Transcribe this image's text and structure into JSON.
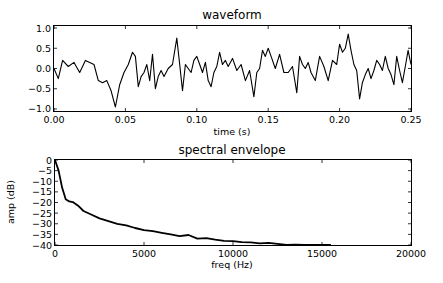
{
  "chart_data": [
    {
      "type": "line",
      "title": "waveform",
      "xlabel": "time (s)",
      "ylabel": "",
      "xlim": [
        0.0,
        0.25
      ],
      "ylim": [
        -1.05,
        1.05
      ],
      "xticks": [
        "0.00",
        "0.05",
        "0.10",
        "0.15",
        "0.20",
        "0.25"
      ],
      "yticks": [
        "1.0",
        "0.5",
        "0.0",
        "−0.5",
        "−1.0"
      ],
      "grid": false,
      "legend": null,
      "series": [
        {
          "name": "waveform",
          "color": "#000000",
          "x": [
            0.0,
            0.003,
            0.006,
            0.01,
            0.014,
            0.018,
            0.022,
            0.025,
            0.028,
            0.031,
            0.034,
            0.037,
            0.04,
            0.043,
            0.046,
            0.049,
            0.052,
            0.055,
            0.057,
            0.059,
            0.061,
            0.063,
            0.065,
            0.067,
            0.069,
            0.071,
            0.073,
            0.075,
            0.077,
            0.08,
            0.083,
            0.086,
            0.088,
            0.09,
            0.092,
            0.094,
            0.096,
            0.098,
            0.1,
            0.102,
            0.104,
            0.106,
            0.108,
            0.11,
            0.112,
            0.114,
            0.116,
            0.118,
            0.12,
            0.122,
            0.125,
            0.128,
            0.131,
            0.134,
            0.137,
            0.14,
            0.142,
            0.144,
            0.146,
            0.148,
            0.15,
            0.152,
            0.155,
            0.158,
            0.161,
            0.164,
            0.167,
            0.17,
            0.172,
            0.174,
            0.176,
            0.178,
            0.18,
            0.183,
            0.186,
            0.189,
            0.192,
            0.195,
            0.198,
            0.2,
            0.202,
            0.204,
            0.206,
            0.208,
            0.21,
            0.212,
            0.214,
            0.216,
            0.218,
            0.22,
            0.222,
            0.224,
            0.226,
            0.228,
            0.23,
            0.232,
            0.234,
            0.236,
            0.238,
            0.24,
            0.242,
            0.244,
            0.246,
            0.248,
            0.25
          ],
          "y": [
            0.0,
            -0.25,
            0.2,
            0.05,
            0.15,
            -0.1,
            0.2,
            0.15,
            0.1,
            -0.3,
            -0.35,
            -0.3,
            -0.55,
            -0.95,
            -0.4,
            -0.1,
            0.1,
            0.4,
            0.3,
            -0.45,
            -0.2,
            -0.1,
            0.1,
            -0.3,
            0.35,
            -0.5,
            -0.2,
            -0.05,
            -0.2,
            0.0,
            0.1,
            0.75,
            0.1,
            -0.55,
            0.1,
            0.0,
            -0.1,
            0.2,
            0.3,
            0.1,
            -0.1,
            0.15,
            -0.3,
            -0.45,
            -0.1,
            0.05,
            0.4,
            0.1,
            0.2,
            0.05,
            0.25,
            -0.05,
            0.1,
            -0.3,
            -0.05,
            -0.7,
            -0.1,
            0.0,
            0.45,
            0.3,
            0.5,
            0.3,
            0.0,
            0.35,
            -0.1,
            -0.1,
            0.05,
            -0.6,
            0.3,
            0.1,
            0.0,
            0.15,
            -0.1,
            -0.3,
            0.3,
            0.05,
            -0.3,
            0.2,
            0.1,
            0.6,
            0.4,
            0.5,
            0.85,
            0.45,
            0.1,
            -0.05,
            -0.75,
            -0.35,
            -0.15,
            0.0,
            -0.25,
            -0.05,
            0.2,
            0.1,
            -0.05,
            0.3,
            0.0,
            -0.15,
            -0.4,
            0.3,
            -0.05,
            -0.35,
            0.05,
            0.45,
            0.1
          ]
        }
      ]
    },
    {
      "type": "line",
      "title": "spectral envelope",
      "xlabel": "freq (Hz)",
      "ylabel": "amp (dB)",
      "xlim": [
        0,
        20000
      ],
      "ylim": [
        -40,
        0
      ],
      "xticks": [
        "0",
        "5000",
        "10000",
        "15000",
        "20000"
      ],
      "yticks": [
        "0",
        "−5",
        "−10",
        "−15",
        "−20",
        "−25",
        "−30",
        "−35",
        "−40"
      ],
      "grid": false,
      "legend": null,
      "series": [
        {
          "name": "spectral envelope",
          "color": "#000000",
          "x": [
            0,
            200,
            400,
            600,
            800,
            1000,
            1300,
            1600,
            2000,
            2500,
            3000,
            3500,
            4000,
            4500,
            5000,
            5500,
            6000,
            6500,
            7000,
            7500,
            8000,
            8500,
            9000,
            9500,
            10000,
            10500,
            11000,
            11500,
            12000,
            12500,
            13000,
            13500,
            14000,
            14500,
            15000,
            15500
          ],
          "y": [
            0,
            -5,
            -13,
            -18.5,
            -19.5,
            -19.8,
            -21.5,
            -24,
            -25.5,
            -27.5,
            -28.8,
            -30,
            -30.8,
            -32,
            -33,
            -33.5,
            -34.3,
            -35,
            -35.8,
            -35.3,
            -37,
            -36.8,
            -37.5,
            -38,
            -38.2,
            -38.7,
            -38.8,
            -39.2,
            -39.0,
            -39.5,
            -40,
            -39.8,
            -40,
            -40,
            -40,
            -40
          ]
        }
      ]
    }
  ]
}
